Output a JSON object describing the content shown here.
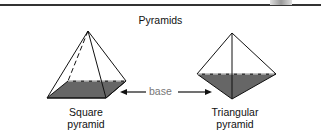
{
  "title": "Pyramids",
  "labels": {
    "square": [
      "Square",
      "pyramid"
    ],
    "triangular": [
      "Triangular",
      "pyramid"
    ],
    "base": "base"
  },
  "colors": {
    "line": "#111111",
    "base_fill": "#666666",
    "base_label": "#777777"
  }
}
